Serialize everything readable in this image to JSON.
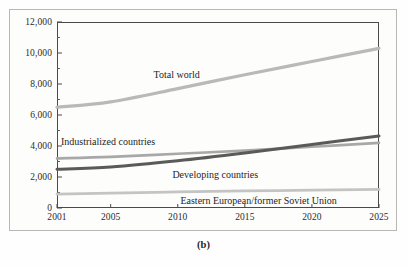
{
  "figure": {
    "caption": "(b)"
  },
  "chart_data": {
    "type": "line",
    "title": "",
    "subtitle": "",
    "xlabel": "",
    "ylabel": "",
    "xlim": [
      2001,
      2025
    ],
    "ylim": [
      0,
      12000
    ],
    "grid": false,
    "legend_position": "inline-annotations",
    "x_ticks": [
      "2001",
      "2005",
      "2010",
      "2015",
      "2020",
      "2025"
    ],
    "x_tick_values": [
      2001,
      2005,
      2010,
      2015,
      2020,
      2025
    ],
    "y_ticks": [
      "0",
      "2,000",
      "4,000",
      "6,000",
      "8,000",
      "10,000",
      "12,000"
    ],
    "y_tick_values": [
      0,
      2000,
      4000,
      6000,
      8000,
      10000,
      12000
    ],
    "y_minor_tick_values": [
      1000,
      3000,
      5000,
      7000,
      9000,
      11000
    ],
    "x": [
      2001,
      2005,
      2010,
      2015,
      2020,
      2025
    ],
    "series": [
      {
        "name": "Total world",
        "color": "#b9b9b9",
        "width": 3.2,
        "values": [
          6500,
          6850,
          7700,
          8600,
          9450,
          10300
        ],
        "label_x": 2008.2,
        "label_y": 8550
      },
      {
        "name": "Industrialized countries",
        "color": "#a8a8a8",
        "width": 2.6,
        "values": [
          3200,
          3300,
          3500,
          3700,
          3950,
          4200
        ],
        "label_x": 2001.3,
        "label_y": 4250
      },
      {
        "name": "Developing countries",
        "color": "#5a5a5a",
        "width": 3.0,
        "values": [
          2500,
          2650,
          3050,
          3550,
          4100,
          4650
        ],
        "label_x": 2009.6,
        "label_y": 2100
      },
      {
        "name": "Eastern European/former Soviet Union",
        "color": "#c4c4c4",
        "width": 2.8,
        "values": [
          900,
          960,
          1040,
          1100,
          1150,
          1200
        ],
        "label_x": 2010.2,
        "label_y": 480
      }
    ]
  }
}
